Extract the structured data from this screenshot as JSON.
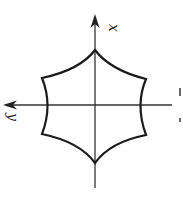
{
  "figure": {
    "axes": {
      "x_label": "x",
      "y_label": "y"
    },
    "curve": {
      "stroke_color": "#1a1a1a",
      "vertices": 6
    },
    "colors": {
      "background": "#ffffff",
      "axis": "#333333",
      "curve": "#1a1a1a"
    }
  }
}
